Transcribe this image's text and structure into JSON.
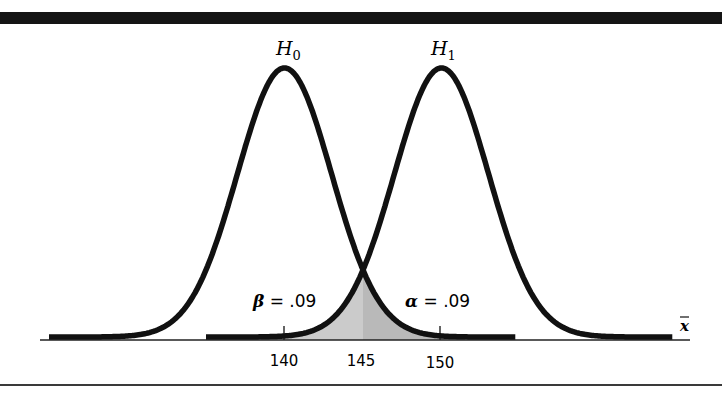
{
  "chart_data": {
    "type": "line",
    "title": "",
    "xlabel": "x̄",
    "ylabel": "",
    "x_ticks": [
      140,
      145,
      150
    ],
    "x_tick_labels": [
      "140",
      "145",
      "150"
    ],
    "xlim": [
      124,
      166
    ],
    "grid": false,
    "legend": "none",
    "series": [
      {
        "name": "H₀",
        "label_main": "H",
        "label_sub": "0",
        "distribution": "normal",
        "mean": 140,
        "sd": 3
      },
      {
        "name": "H₁",
        "label_main": "H",
        "label_sub": "1",
        "distribution": "normal",
        "mean": 150,
        "sd": 3
      }
    ],
    "critical_value": 145,
    "shaded_regions": [
      {
        "name": "beta",
        "under": "H₁",
        "from": 140,
        "to": 145,
        "color": "#cbcbcb"
      },
      {
        "name": "alpha",
        "under": "H₀",
        "from": 145,
        "to": 150,
        "color": "#b9b9b9"
      }
    ],
    "annotations": [
      {
        "id": "beta",
        "symbol": "β",
        "text": " = .09",
        "value": 0.09
      },
      {
        "id": "alpha",
        "symbol": "α",
        "text": " = .09",
        "value": 0.09
      }
    ]
  },
  "colors": {
    "curve": "#111111",
    "axis": "#222222",
    "frame": "#151515"
  },
  "labels": {
    "h0_main": "H",
    "h0_sub": "0",
    "h1_main": "H",
    "h1_sub": "1",
    "beta_symbol": "β",
    "beta_text": " = .09",
    "alpha_symbol": "α",
    "alpha_text": " = .09",
    "xbar": "x",
    "tick_140": "140",
    "tick_145": "145",
    "tick_150": "150"
  }
}
